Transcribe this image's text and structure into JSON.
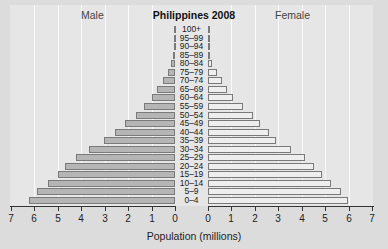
{
  "chart_data": {
    "type": "bar",
    "subtype": "population-pyramid",
    "title": "Philippines 2008",
    "xlabel": "Population (millions)",
    "ylabel": "",
    "left_label": "Male",
    "right_label": "Female",
    "xlim": [
      0,
      7
    ],
    "x_ticks_left": [
      "7",
      "6",
      "5",
      "4",
      "3",
      "2",
      "1",
      "0"
    ],
    "x_ticks_right": [
      "0",
      "1",
      "2",
      "3",
      "4",
      "5",
      "6",
      "7"
    ],
    "grid": "vertical",
    "categories": [
      "0–4",
      "5–9",
      "10–14",
      "15–19",
      "20–24",
      "25–29",
      "30–34",
      "35–39",
      "40–44",
      "45–49",
      "50–54",
      "55–59",
      "60–64",
      "65–69",
      "70–74",
      "75–79",
      "80–84",
      "85–89",
      "90–94",
      "95–99",
      "100+"
    ],
    "series": [
      {
        "name": "Male",
        "color": "#b5b5b5",
        "values": [
          6.24,
          5.88,
          5.41,
          5.01,
          4.7,
          4.24,
          3.66,
          3.02,
          2.56,
          2.12,
          1.68,
          1.31,
          1.0,
          0.76,
          0.5,
          0.31,
          0.18,
          0.07,
          0.03,
          0.01,
          0.005
        ]
      },
      {
        "name": "Female",
        "color": "#eeeeee",
        "values": [
          5.98,
          5.67,
          5.24,
          4.86,
          4.54,
          4.12,
          3.53,
          2.92,
          2.58,
          2.22,
          1.91,
          1.48,
          1.08,
          0.82,
          0.6,
          0.37,
          0.19,
          0.08,
          0.03,
          0.01,
          0.005
        ]
      }
    ]
  }
}
